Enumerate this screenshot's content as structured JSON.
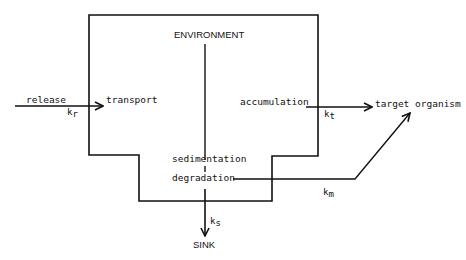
{
  "diagram": {
    "box_label": "ENVIRONMENT",
    "nodes": {
      "release": "release",
      "transport": "transport",
      "accumulation": "accumulation",
      "target": "target organism",
      "sedimentation": "sedimentation",
      "degradation": "degradation",
      "sink": "SINK"
    },
    "rates": {
      "kr": {
        "k": "k",
        "sub": "r"
      },
      "kt": {
        "k": "k",
        "sub": "t"
      },
      "km": {
        "k": "k",
        "sub": "m"
      },
      "ks": {
        "k": "k",
        "sub": "s"
      }
    },
    "edges": [
      {
        "from": "release",
        "to": "transport",
        "rate": "kr"
      },
      {
        "from": "accumulation",
        "to": "target organism",
        "rate": "kt"
      },
      {
        "from": "degradation",
        "to": "target organism",
        "rate": "km"
      },
      {
        "from": "sedimentation",
        "to": "SINK",
        "rate": "ks"
      }
    ],
    "stroke_color": "#111111"
  }
}
